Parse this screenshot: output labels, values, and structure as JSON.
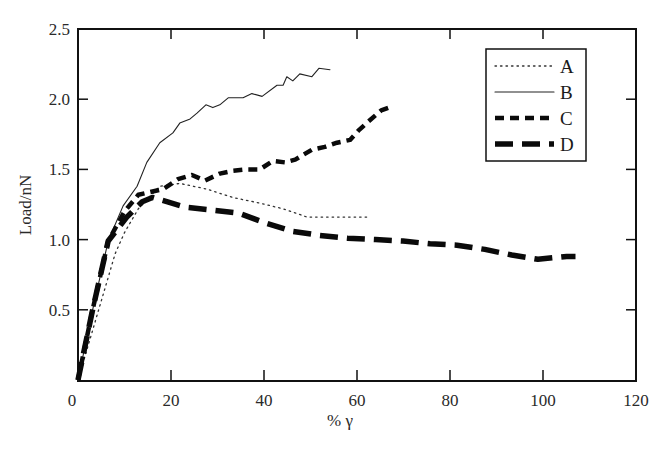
{
  "chart_data": {
    "type": "line",
    "title": "",
    "xlabel": "% γ",
    "ylabel": "Load/nN",
    "xlim": [
      0,
      120
    ],
    "ylim": [
      0,
      2.5
    ],
    "xticks": [
      0,
      20,
      40,
      60,
      80,
      100,
      120
    ],
    "xtick_labels": [
      "0",
      "20",
      "40",
      "60",
      "80",
      "100",
      "120"
    ],
    "yticks": [
      0.5,
      1.0,
      1.5,
      2.0,
      2.5
    ],
    "ytick_labels": [
      "0.5",
      "1.0",
      "1.5",
      "2.0",
      "2.5"
    ],
    "grid": false,
    "legend_position": "top-right",
    "series": [
      {
        "name": "A",
        "style": "dotted",
        "x": [
          0,
          4,
          8,
          10,
          13,
          17.6,
          21.9,
          27.7,
          33.3,
          39.1,
          44,
          49.3,
          53.5,
          59.1,
          62.2
        ],
        "y": [
          0,
          0.45,
          0.9,
          1.05,
          1.22,
          1.38,
          1.4,
          1.36,
          1.3,
          1.26,
          1.22,
          1.16,
          1.16,
          1.16,
          1.16
        ]
      },
      {
        "name": "B",
        "style": "solid",
        "x": [
          0,
          3,
          6.5,
          9.7,
          12.7,
          14.8,
          17.6,
          20.4,
          21.9,
          24.1,
          25.6,
          27.5,
          29.0,
          30.5,
          32.3,
          35.5,
          37.4,
          39.6,
          42.8,
          44.1,
          44.9,
          46.2,
          47.7,
          50.3,
          51.8,
          54.2
        ],
        "y": [
          0,
          0.48,
          0.99,
          1.24,
          1.38,
          1.55,
          1.69,
          1.76,
          1.83,
          1.86,
          1.9,
          1.96,
          1.94,
          1.96,
          2.01,
          2.01,
          2.04,
          2.02,
          2.1,
          2.1,
          2.16,
          2.13,
          2.18,
          2.16,
          2.22,
          2.21
        ]
      },
      {
        "name": "C",
        "style": "short-dash",
        "x": [
          0,
          3,
          6.5,
          10,
          13,
          18.3,
          21.5,
          24.5,
          27.3,
          30.5,
          33.3,
          36.3,
          39.1,
          41.9,
          44.5,
          46.7,
          50.3,
          53.1,
          55.7,
          58.5,
          60.4,
          62.4,
          65.2,
          67.7
        ],
        "y": [
          0,
          0.48,
          0.99,
          1.2,
          1.32,
          1.36,
          1.43,
          1.46,
          1.42,
          1.47,
          1.49,
          1.5,
          1.5,
          1.56,
          1.55,
          1.57,
          1.64,
          1.66,
          1.69,
          1.71,
          1.78,
          1.84,
          1.92,
          1.95
        ]
      },
      {
        "name": "D",
        "style": "long-dash",
        "x": [
          0,
          3,
          6.5,
          10.5,
          13.8,
          16,
          19.1,
          23.2,
          28.9,
          34.4,
          40.2,
          46,
          52,
          58,
          64,
          69.9,
          75.7,
          81.5,
          87.5,
          93.3,
          98.9,
          105.1,
          107
        ],
        "y": [
          0,
          0.48,
          0.99,
          1.16,
          1.27,
          1.3,
          1.27,
          1.23,
          1.21,
          1.19,
          1.12,
          1.06,
          1.03,
          1.01,
          1.0,
          0.99,
          0.97,
          0.96,
          0.93,
          0.89,
          0.86,
          0.88,
          0.88
        ]
      }
    ]
  }
}
